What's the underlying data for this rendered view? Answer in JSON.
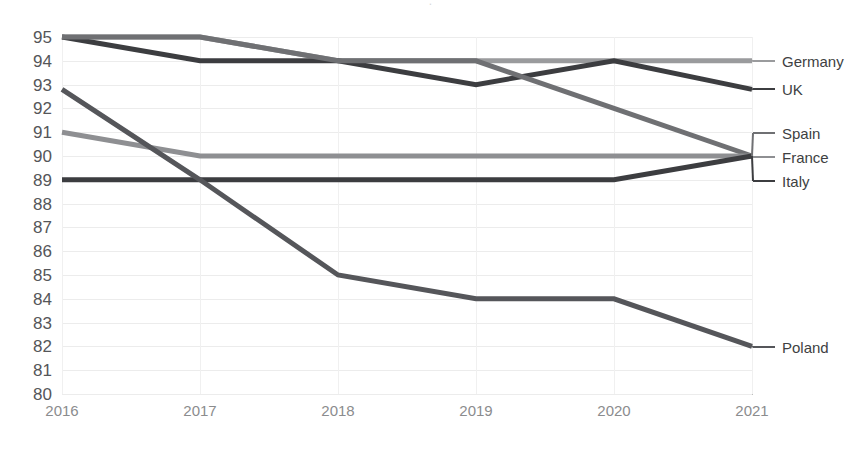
{
  "chart_data": {
    "type": "line",
    "title": "",
    "xlabel": "",
    "ylabel": "",
    "categories": [
      "2016",
      "2017",
      "2018",
      "2019",
      "2020",
      "2021"
    ],
    "x": [
      2016,
      2017,
      2018,
      2019,
      2020,
      2021
    ],
    "ylim": [
      80,
      95
    ],
    "ytick_step": 1,
    "yticks": [
      95,
      94,
      93,
      92,
      91,
      90,
      89,
      88,
      87,
      86,
      85,
      84,
      83,
      82,
      81,
      80
    ],
    "grid": true,
    "legend_position": "right-inline",
    "series": [
      {
        "name": "Germany",
        "values": [
          95,
          95,
          94,
          94,
          94,
          94
        ],
        "color": "#9a9b9d",
        "label_value": 94
      },
      {
        "name": "UK",
        "values": [
          95,
          94,
          94,
          93,
          94,
          92.8
        ],
        "color": "#3c3d40",
        "label_value": 92.8
      },
      {
        "name": "Spain",
        "values": [
          95,
          95,
          94,
          94,
          92,
          90
        ],
        "color": "#6f7073",
        "label_value": 90
      },
      {
        "name": "France",
        "values": [
          91,
          90,
          90,
          90,
          90,
          90
        ],
        "color": "#8e8f92",
        "label_value": 90
      },
      {
        "name": "Italy",
        "values": [
          89,
          89,
          89,
          89,
          89,
          90
        ],
        "color": "#3c3d40",
        "label_value": 90
      },
      {
        "name": "Poland",
        "values": [
          92.8,
          89,
          85,
          84,
          84,
          82
        ],
        "color": "#55565a",
        "label_value": 82
      }
    ]
  },
  "axis": {
    "y_labels": [
      "95",
      "94",
      "93",
      "92",
      "91",
      "90",
      "89",
      "88",
      "87",
      "86",
      "85",
      "84",
      "83",
      "82",
      "81",
      "80"
    ],
    "x_labels": [
      "2016",
      "2017",
      "2018",
      "2019",
      "2020",
      "2021"
    ]
  },
  "legend": {
    "items": [
      {
        "label": "Germany",
        "color": "#9a9b9d",
        "y": 61
      },
      {
        "label": "UK",
        "color": "#3c3d40",
        "y": 89
      },
      {
        "label": "Spain",
        "color": "#6f7073",
        "y": 133
      },
      {
        "label": "France",
        "color": "#8e8f92",
        "y": 157
      },
      {
        "label": "Italy",
        "color": "#3c3d40",
        "y": 181
      },
      {
        "label": "Poland",
        "color": "#55565a",
        "y": 347
      }
    ]
  },
  "title_fragment": {
    "text": "."
  }
}
